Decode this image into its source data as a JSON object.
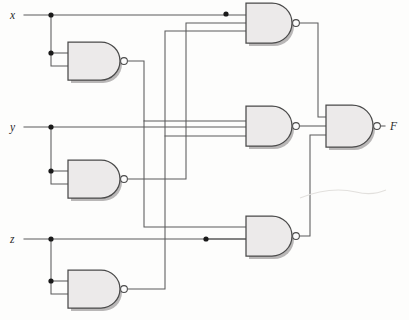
{
  "figure": {
    "canvas": {
      "width": 409,
      "height": 320,
      "background": "#fdfdfc"
    },
    "style": {
      "wire_color": "#5b5b5b",
      "gate_fill": "#eceaea",
      "gate_stroke": "#4a4a4a",
      "junction_color": "#1a1a1a",
      "bubble_fill": "#fbfbfb",
      "label_color": "#2a2a2a"
    }
  },
  "ports": {
    "inputs": [
      {
        "id": "x",
        "label": "x",
        "x": 12,
        "y": 22,
        "rail_y": 15
      },
      {
        "id": "y",
        "label": "y",
        "x": 12,
        "y": 132,
        "rail_y": 127
      },
      {
        "id": "z",
        "label": "z",
        "x": 12,
        "y": 244,
        "rail_y": 239
      }
    ],
    "outputs": [
      {
        "id": "F",
        "label": "F",
        "x": 392,
        "y": 129,
        "rail_y": 125
      }
    ]
  },
  "gates": [
    {
      "id": "g1",
      "name": "nand-x-inverter",
      "type": "NAND",
      "inputs": 2,
      "input_labels": [
        "x",
        "x"
      ],
      "output_label": "x'",
      "x": 68,
      "y": 42,
      "width": 52,
      "height": 38
    },
    {
      "id": "g2",
      "name": "nand-y-inverter",
      "type": "NAND",
      "inputs": 2,
      "input_labels": [
        "y",
        "y"
      ],
      "output_label": "y'",
      "x": 68,
      "y": 160,
      "width": 52,
      "height": 38
    },
    {
      "id": "g3",
      "name": "nand-z-inverter",
      "type": "NAND",
      "inputs": 2,
      "input_labels": [
        "z",
        "z"
      ],
      "output_label": "z'",
      "x": 68,
      "y": 270,
      "width": 52,
      "height": 38
    },
    {
      "id": "g4",
      "name": "nand-top-term",
      "type": "NAND",
      "inputs": 3,
      "input_labels": [
        "x",
        "y'",
        "z'"
      ],
      "output_label": "t1",
      "x": 246,
      "y": 3,
      "width": 46,
      "height": 40
    },
    {
      "id": "g5",
      "name": "nand-middle-term",
      "type": "NAND",
      "inputs": 3,
      "input_labels": [
        "x'",
        "y",
        "z'"
      ],
      "output_label": "t2",
      "x": 246,
      "y": 106,
      "width": 46,
      "height": 40
    },
    {
      "id": "g6",
      "name": "nand-bottom-term",
      "type": "NAND",
      "inputs": 2,
      "input_labels": [
        "x'",
        "z"
      ],
      "output_label": "t3",
      "x": 246,
      "y": 216,
      "width": 46,
      "height": 40
    },
    {
      "id": "g7",
      "name": "nand-output",
      "type": "NAND",
      "inputs": 3,
      "input_labels": [
        "t1",
        "t2",
        "t3"
      ],
      "output_label": "F",
      "x": 326,
      "y": 105,
      "width": 46,
      "height": 42
    }
  ],
  "junctions": [
    {
      "id": "j-x-1",
      "x": 51,
      "y": 15,
      "on": "x-rail"
    },
    {
      "id": "j-x-2",
      "x": 51,
      "y": 53,
      "on": "x-branch"
    },
    {
      "id": "j-x-3",
      "x": 226,
      "y": 14,
      "on": "x-rail"
    },
    {
      "id": "j-y-1",
      "x": 51,
      "y": 127,
      "on": "y-rail"
    },
    {
      "id": "j-y-2",
      "x": 51,
      "y": 171,
      "on": "y-branch"
    },
    {
      "id": "j-z-1",
      "x": 51,
      "y": 239,
      "on": "z-rail"
    },
    {
      "id": "j-z-2",
      "x": 51,
      "y": 281,
      "on": "z-branch"
    },
    {
      "id": "j-z-3",
      "x": 206,
      "y": 239,
      "on": "z-rail"
    }
  ],
  "nets": [
    {
      "id": "net-x",
      "from": "x",
      "to": [
        "g1.in0",
        "g1.in1",
        "g4.in0"
      ]
    },
    {
      "id": "net-y",
      "from": "y",
      "to": [
        "g2.in0",
        "g2.in1",
        "g5.in1"
      ]
    },
    {
      "id": "net-z",
      "from": "z",
      "to": [
        "g3.in0",
        "g3.in1",
        "g6.in1"
      ]
    },
    {
      "id": "net-xbar",
      "from": "g1.out",
      "to": [
        "g5.in0",
        "g6.in0"
      ]
    },
    {
      "id": "net-ybar",
      "from": "g2.out",
      "to": [
        "g4.in1"
      ]
    },
    {
      "id": "net-zbar",
      "from": "g3.out",
      "to": [
        "g4.in2",
        "g5.in2"
      ]
    },
    {
      "id": "net-t1",
      "from": "g4.out",
      "to": [
        "g7.in0"
      ]
    },
    {
      "id": "net-t2",
      "from": "g5.out",
      "to": [
        "g7.in1"
      ]
    },
    {
      "id": "net-t3",
      "from": "g6.out",
      "to": [
        "g7.in2"
      ]
    },
    {
      "id": "net-F",
      "from": "g7.out",
      "to": [
        "F"
      ]
    }
  ]
}
